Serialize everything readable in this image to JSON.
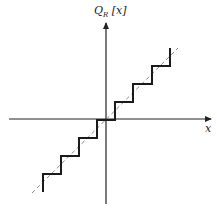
{
  "figure": {
    "y_axis_label_main": "Q",
    "y_axis_label_sub": "R",
    "y_axis_label_arg": "[x]",
    "x_axis_label": "x"
  },
  "colors": {
    "axis": "#222222",
    "staircase": "#1a1a1a",
    "dashed_line": "#888888"
  },
  "diagram": {
    "type": "uniform midtread quantizer transfer characteristic",
    "staircase_points": "12,193 12,174 30,174 30,156 48,156 48,138 66,138 66,120 74,120 74,119 96,119 96,102 116,102 116,102",
    "upper_staircase_points": "96,119 116,119 116,102 134,102 134,84 152,84 152,66 170,66 170,48",
    "lower_staircase_points": "96,119 96,138 78,138 78,156 60,156 60,174 42,174 42,193",
    "identity_line": {
      "x1": 32,
      "y1": 193,
      "x2": 178,
      "y2": 48
    }
  }
}
